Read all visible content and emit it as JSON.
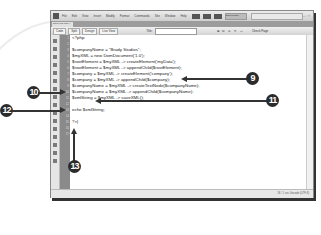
{
  "app": {
    "menu": [
      "File",
      "Edit",
      "View",
      "Insert",
      "Modify",
      "Format",
      "Commands",
      "Site",
      "Window",
      "Help"
    ],
    "workspace": "DESIGNER",
    "window_controls": "– □ ×"
  },
  "document_tab": {
    "label": "saveXML.php ×"
  },
  "toolbar": {
    "views": [
      "Code",
      "Split",
      "Design"
    ],
    "live_view": "Live View",
    "title_label": "Title:",
    "title_value": "",
    "tool_icons": "⊞ ⊡ ⊙ ↻ ▭",
    "check_page": "Check Page"
  },
  "gutter": {
    "line_numbers": [
      "1",
      "2",
      "3",
      "4",
      "5",
      "6",
      "7",
      "8",
      "9",
      "10",
      "11",
      "12",
      "13",
      "14",
      "15",
      "16",
      "17"
    ]
  },
  "code": {
    "lines": [
      "<?php",
      "",
      "$companyName = \"Brady Studios\";",
      "$myXML = new DomDocument('1.0');",
      "$rootElement = $myXML -> createElement('myData');",
      "$rootElement = $myXML -> appendChild($rootElement);",
      "$company = $myXML -> createElement('company');",
      "$company = $myXML -> appendChild($company);",
      "$companyName = $myXML -> createTextNode($companyName);",
      "$companyName = $myXML -> appendChild($companyName);",
      "$xmlString = $myXML -> saveXML();",
      "",
      "echo $xmlString;",
      "",
      "?>|"
    ]
  },
  "status_bar": {
    "text": "1K / 1 sec  Unicode (UTF-8)"
  },
  "callouts": [
    {
      "label": "9"
    },
    {
      "label": "10"
    },
    {
      "label": "11"
    },
    {
      "label": "12"
    },
    {
      "label": "13"
    }
  ]
}
